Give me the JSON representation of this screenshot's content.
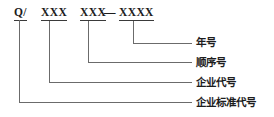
{
  "diagram": {
    "type": "standard-number-breakdown",
    "formula": {
      "segments": [
        {
          "id": "prefix",
          "text": "Q/",
          "underlined": true
        },
        {
          "id": "enterprise",
          "text": "XXX",
          "underlined": true
        },
        {
          "id": "sequence",
          "text": "XXX",
          "underlined": true
        },
        {
          "id": "year",
          "text": "XXXX",
          "underlined": true
        }
      ],
      "separator": "—"
    },
    "labels": [
      {
        "id": "year-label",
        "text": "年号"
      },
      {
        "id": "sequence-label",
        "text": "顺序号"
      },
      {
        "id": "enterprise-code-label",
        "text": "企业代号"
      },
      {
        "id": "enterprise-standard-label",
        "text": "企业标准代号"
      }
    ],
    "colors": {
      "line": "#6b6b6b",
      "text": "#1c1c1c",
      "background": "#ffffff"
    }
  }
}
